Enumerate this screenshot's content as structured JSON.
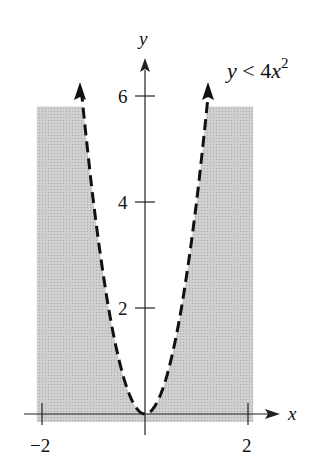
{
  "chart_data": {
    "type": "area",
    "title": "",
    "inequality_label": "y < 4x²",
    "inequality_label_parts": {
      "lhs": "y < 4",
      "var": "x",
      "exp": "2"
    },
    "xlabel": "x",
    "ylabel": "y",
    "xlim": [
      -2,
      2
    ],
    "ylim": [
      0,
      6
    ],
    "x_ticks": [
      {
        "value": -2,
        "label": "−2"
      },
      {
        "value": 2,
        "label": "2"
      }
    ],
    "y_ticks": [
      {
        "value": 2,
        "label": "2"
      },
      {
        "value": 4,
        "label": "4"
      },
      {
        "value": 6,
        "label": "6"
      }
    ],
    "boundary": {
      "equation": "y = 4x^2",
      "style": "dashed",
      "arrows": "both ends"
    },
    "shaded_region": "below the parabola y = 4x^2, for -2 ≤ x ≤ 2, 0 ≤ y ≤ 6",
    "shade_color": "#c8c8c8",
    "grid": false,
    "legend": "none"
  }
}
